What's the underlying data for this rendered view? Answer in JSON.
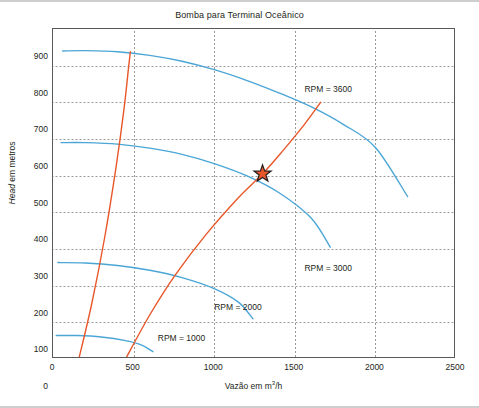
{
  "chart_data": {
    "type": "line",
    "title": "Bomba para Terminal Oceânico",
    "xlabel_prefix": "Vazão em m",
    "xlabel_sup": "3",
    "xlabel_suffix": "/h",
    "ylabel_italic": "Head",
    "ylabel_rest": " em metros",
    "xlim": [
      0,
      2500
    ],
    "ylim": [
      0,
      900
    ],
    "xticks": [
      0,
      500,
      1000,
      1500,
      2000,
      2500
    ],
    "yticks": [
      0,
      100,
      200,
      300,
      400,
      500,
      600,
      700,
      800,
      900
    ],
    "grid": true,
    "legend_position": "inline-annotations",
    "series": [
      {
        "name": "RPM = 3600",
        "color": "#4BA6D6",
        "label_x": 1560,
        "label_y": 735,
        "points": [
          [
            60,
            840
          ],
          [
            200,
            841
          ],
          [
            400,
            838
          ],
          [
            600,
            828
          ],
          [
            800,
            812
          ],
          [
            1000,
            789
          ],
          [
            1200,
            760
          ],
          [
            1400,
            726
          ],
          [
            1600,
            688
          ],
          [
            1800,
            640
          ],
          [
            2000,
            577
          ],
          [
            2200,
            443
          ]
        ]
      },
      {
        "name": "RPM = 3000",
        "color": "#4BA6D6",
        "label_x": 1560,
        "label_y": 245,
        "points": [
          [
            50,
            590
          ],
          [
            200,
            590
          ],
          [
            400,
            586
          ],
          [
            600,
            575
          ],
          [
            800,
            558
          ],
          [
            1000,
            533
          ],
          [
            1200,
            500
          ],
          [
            1400,
            454
          ],
          [
            1600,
            385
          ],
          [
            1720,
            305
          ]
        ]
      },
      {
        "name": "RPM = 2000",
        "color": "#4BA6D6",
        "label_x": 1000,
        "label_y": 140,
        "points": [
          [
            30,
            263
          ],
          [
            200,
            262
          ],
          [
            400,
            255
          ],
          [
            600,
            242
          ],
          [
            800,
            222
          ],
          [
            1000,
            192
          ],
          [
            1150,
            155
          ],
          [
            1240,
            110
          ]
        ]
      },
      {
        "name": "RPM = 1000",
        "color": "#4BA6D6",
        "label_x": 650,
        "label_y": 55,
        "points": [
          [
            20,
            64
          ],
          [
            150,
            64
          ],
          [
            300,
            60
          ],
          [
            450,
            50
          ],
          [
            550,
            38
          ],
          [
            620,
            20
          ]
        ]
      },
      {
        "name": "curva-sistema-1",
        "color": "#E8572A",
        "points": [
          [
            160,
            0
          ],
          [
            240,
            150
          ],
          [
            320,
            330
          ],
          [
            390,
            520
          ],
          [
            440,
            680
          ],
          [
            470,
            800
          ],
          [
            480,
            838
          ]
        ]
      },
      {
        "name": "curva-sistema-2",
        "color": "#E8572A",
        "points": [
          [
            450,
            0
          ],
          [
            600,
            120
          ],
          [
            760,
            230
          ],
          [
            950,
            340
          ],
          [
            1150,
            440
          ],
          [
            1300,
            505
          ],
          [
            1420,
            565
          ],
          [
            1560,
            640
          ],
          [
            1660,
            700
          ]
        ]
      }
    ],
    "marker": {
      "name": "ponto-de-operacao",
      "shape": "star",
      "x": 1300,
      "y": 505,
      "color": "#E8572A",
      "outline": "#231f20"
    }
  }
}
